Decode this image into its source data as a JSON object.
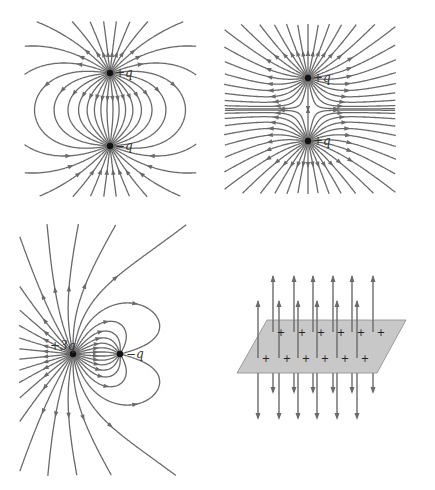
{
  "figure": {
    "panels": [
      {
        "id": "dipole",
        "description": "Field lines of an electric dipole",
        "charges": [
          {
            "label": "+q",
            "sign": "positive",
            "x": 110,
            "y": 73
          },
          {
            "label": "−q",
            "sign": "negative",
            "x": 110,
            "y": 146
          }
        ]
      },
      {
        "id": "two-positive",
        "description": "Field lines of two equal positive charges",
        "charges": [
          {
            "label": "+q",
            "sign": "positive",
            "x": 308,
            "y": 78
          },
          {
            "label": "+q",
            "sign": "positive",
            "x": 308,
            "y": 141
          }
        ]
      },
      {
        "id": "unequal-charges",
        "description": "Field lines of +3q and -q",
        "charges": [
          {
            "label": "+3q",
            "sign": "positive",
            "x": 73,
            "y": 354
          },
          {
            "label": "−q",
            "sign": "negative",
            "x": 120,
            "y": 354
          }
        ]
      },
      {
        "id": "charged-sheet",
        "description": "Uniform field of an infinite positively charged plane",
        "plane_color": "#c8c8c8",
        "charge_symbol": "+",
        "charge_count": 12
      }
    ],
    "colors": {
      "field_line": "#6a6a6a",
      "charge": "#111111",
      "plane": "#c8c8c8"
    }
  }
}
